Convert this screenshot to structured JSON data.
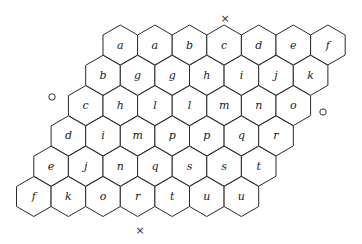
{
  "diagram": {
    "type": "hex-board",
    "rows": 6,
    "columns": 7,
    "cells": [
      [
        "a",
        "a",
        "b",
        "c",
        "d",
        "e",
        "f"
      ],
      [
        "b",
        "g",
        "g",
        "h",
        "i",
        "j",
        "k"
      ],
      [
        "c",
        "h",
        "l",
        "l",
        "m",
        "n",
        "o"
      ],
      [
        "d",
        "i",
        "m",
        "p",
        "p",
        "q",
        "r"
      ],
      [
        "e",
        "j",
        "n",
        "q",
        "s",
        "s",
        "t"
      ],
      [
        "f",
        "k",
        "o",
        "r",
        "t",
        "u",
        "u"
      ]
    ],
    "markers": [
      {
        "kind": "cross",
        "symbol": "×",
        "position": "top",
        "x": 225,
        "y": 18
      },
      {
        "kind": "cross",
        "symbol": "×",
        "position": "bottom",
        "x": 140,
        "y": 230
      },
      {
        "kind": "circle",
        "symbol": "○",
        "position": "left",
        "x": 52,
        "y": 97
      },
      {
        "kind": "circle",
        "symbol": "○",
        "position": "right",
        "x": 323,
        "y": 112
      }
    ]
  },
  "colors": {
    "stroke": "#2a2a2a",
    "text": "#1a1a1a",
    "background": "#ffffff"
  }
}
